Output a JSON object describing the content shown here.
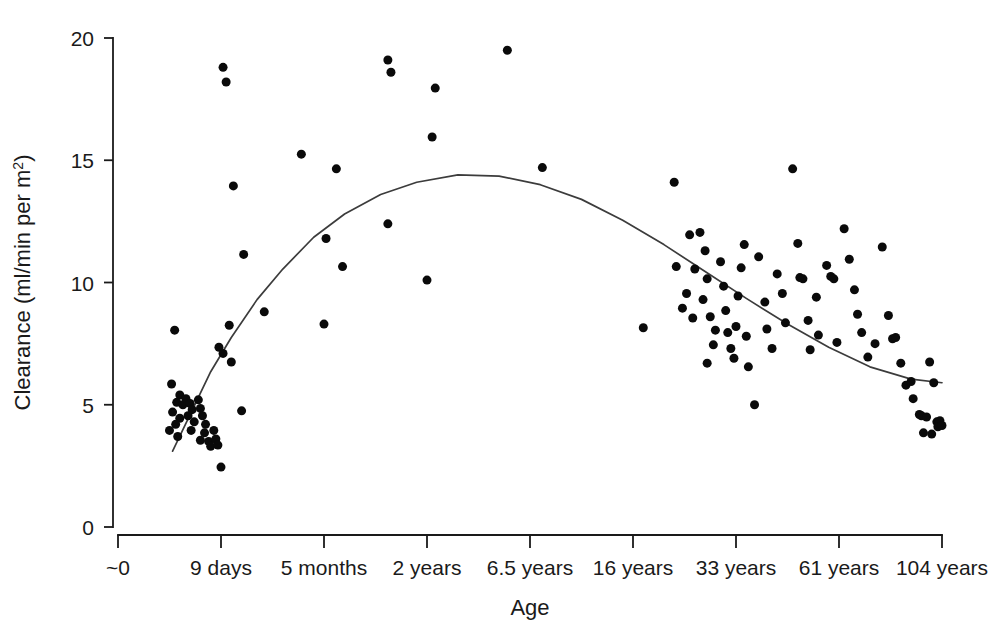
{
  "chart_data": {
    "type": "scatter",
    "title": "",
    "xlabel": "Age",
    "ylabel": "Clearance (ml/min per m2)",
    "ylabel_parts": {
      "main": "Clearance (ml/min per m",
      "sup": "2",
      "tail": ")"
    },
    "grid": false,
    "legend": null,
    "ylim": [
      0,
      20
    ],
    "yticks": [
      0,
      5,
      10,
      15,
      20
    ],
    "ytick_labels": [
      "0",
      "5",
      "10",
      "15",
      "20"
    ],
    "xlim": [
      0,
      8
    ],
    "xticks": [
      0,
      1,
      2,
      3,
      4,
      5,
      6,
      7,
      8
    ],
    "xtick_labels": [
      "~0",
      "9 days",
      "5 months",
      "2 years",
      "6.5 years",
      "16 years",
      "33 years",
      "61 years",
      "104 years"
    ],
    "xtick_label_positions": [
      0,
      1,
      2,
      3,
      4,
      5,
      6,
      7,
      8
    ],
    "marker": {
      "shape": "circle",
      "color": "#0a0a0a",
      "size_px": 9
    },
    "fit_curve": {
      "name": "smoothed fit",
      "color": "#3c3c3c",
      "x": [
        0.53,
        0.7,
        0.9,
        1.1,
        1.35,
        1.6,
        1.9,
        2.2,
        2.55,
        2.9,
        3.3,
        3.7,
        4.1,
        4.5,
        4.9,
        5.3,
        5.7,
        6.1,
        6.5,
        6.9,
        7.3,
        7.7,
        8.0
      ],
      "y": [
        3.1,
        4.6,
        6.35,
        7.75,
        9.3,
        10.55,
        11.85,
        12.8,
        13.6,
        14.1,
        14.4,
        14.35,
        14.0,
        13.4,
        12.55,
        11.55,
        10.45,
        9.35,
        8.3,
        7.35,
        6.55,
        6.05,
        5.9
      ]
    },
    "points": [
      [
        0.55,
        8.05
      ],
      [
        0.52,
        5.85
      ],
      [
        0.6,
        5.4
      ],
      [
        0.57,
        5.1
      ],
      [
        0.63,
        5.0
      ],
      [
        0.53,
        4.7
      ],
      [
        0.6,
        4.45
      ],
      [
        0.56,
        4.2
      ],
      [
        0.5,
        3.95
      ],
      [
        0.58,
        3.7
      ],
      [
        0.66,
        5.25
      ],
      [
        0.7,
        5.05
      ],
      [
        0.72,
        4.8
      ],
      [
        0.68,
        4.55
      ],
      [
        0.74,
        4.3
      ],
      [
        0.71,
        3.95
      ],
      [
        0.78,
        5.2
      ],
      [
        0.8,
        4.85
      ],
      [
        0.82,
        4.55
      ],
      [
        0.85,
        4.2
      ],
      [
        0.84,
        3.85
      ],
      [
        0.8,
        3.55
      ],
      [
        0.88,
        3.5
      ],
      [
        0.9,
        3.3
      ],
      [
        0.93,
        3.95
      ],
      [
        0.95,
        3.6
      ],
      [
        0.97,
        3.35
      ],
      [
        1.0,
        2.45
      ],
      [
        1.02,
        18.8
      ],
      [
        1.05,
        18.2
      ],
      [
        1.12,
        13.95
      ],
      [
        1.22,
        11.15
      ],
      [
        1.08,
        8.25
      ],
      [
        0.98,
        7.35
      ],
      [
        1.02,
        7.1
      ],
      [
        1.1,
        6.75
      ],
      [
        1.2,
        4.75
      ],
      [
        1.42,
        8.8
      ],
      [
        1.78,
        15.25
      ],
      [
        2.12,
        14.65
      ],
      [
        2.02,
        11.8
      ],
      [
        2.18,
        10.65
      ],
      [
        2.0,
        8.3
      ],
      [
        2.62,
        19.1
      ],
      [
        2.65,
        18.6
      ],
      [
        2.62,
        12.4
      ],
      [
        3.08,
        17.95
      ],
      [
        3.05,
        15.95
      ],
      [
        3.0,
        10.1
      ],
      [
        3.78,
        19.5
      ],
      [
        4.12,
        14.7
      ],
      [
        5.1,
        8.15
      ],
      [
        5.4,
        14.1
      ],
      [
        5.42,
        10.65
      ],
      [
        5.55,
        11.95
      ],
      [
        5.6,
        10.55
      ],
      [
        5.52,
        9.55
      ],
      [
        5.48,
        8.95
      ],
      [
        5.58,
        8.55
      ],
      [
        5.65,
        12.05
      ],
      [
        5.7,
        11.3
      ],
      [
        5.72,
        10.15
      ],
      [
        5.68,
        9.3
      ],
      [
        5.75,
        8.6
      ],
      [
        5.8,
        8.05
      ],
      [
        5.78,
        7.45
      ],
      [
        5.72,
        6.7
      ],
      [
        5.85,
        10.85
      ],
      [
        5.88,
        9.85
      ],
      [
        5.9,
        8.85
      ],
      [
        5.92,
        7.95
      ],
      [
        5.95,
        7.3
      ],
      [
        5.98,
        6.9
      ],
      [
        6.0,
        8.2
      ],
      [
        6.02,
        9.45
      ],
      [
        6.05,
        10.6
      ],
      [
        6.08,
        11.55
      ],
      [
        6.1,
        7.8
      ],
      [
        6.12,
        6.55
      ],
      [
        6.18,
        5.0
      ],
      [
        6.22,
        11.05
      ],
      [
        6.28,
        9.2
      ],
      [
        6.3,
        8.1
      ],
      [
        6.35,
        7.3
      ],
      [
        6.4,
        10.35
      ],
      [
        6.45,
        9.55
      ],
      [
        6.48,
        8.35
      ],
      [
        6.55,
        14.65
      ],
      [
        6.6,
        11.6
      ],
      [
        6.62,
        10.2
      ],
      [
        6.65,
        10.15
      ],
      [
        6.7,
        8.45
      ],
      [
        6.72,
        7.25
      ],
      [
        6.78,
        9.4
      ],
      [
        6.8,
        7.85
      ],
      [
        6.88,
        10.7
      ],
      [
        6.92,
        10.25
      ],
      [
        6.95,
        10.15
      ],
      [
        6.98,
        7.55
      ],
      [
        7.05,
        12.2
      ],
      [
        7.1,
        10.95
      ],
      [
        7.15,
        9.7
      ],
      [
        7.18,
        8.7
      ],
      [
        7.22,
        7.95
      ],
      [
        7.28,
        6.95
      ],
      [
        7.35,
        7.5
      ],
      [
        7.42,
        11.45
      ],
      [
        7.48,
        8.65
      ],
      [
        7.52,
        7.7
      ],
      [
        7.55,
        7.75
      ],
      [
        7.6,
        6.7
      ],
      [
        7.65,
        5.8
      ],
      [
        7.7,
        5.95
      ],
      [
        7.72,
        5.25
      ],
      [
        7.78,
        4.6
      ],
      [
        7.8,
        4.55
      ],
      [
        7.85,
        4.5
      ],
      [
        7.88,
        6.75
      ],
      [
        7.92,
        5.9
      ],
      [
        7.95,
        4.3
      ],
      [
        7.98,
        4.35
      ],
      [
        7.82,
        3.85
      ],
      [
        7.9,
        3.8
      ],
      [
        7.96,
        4.1
      ],
      [
        8.0,
        4.15
      ]
    ]
  },
  "axes": {
    "y_axis_name": "clearance-axis",
    "x_axis_name": "age-axis"
  }
}
